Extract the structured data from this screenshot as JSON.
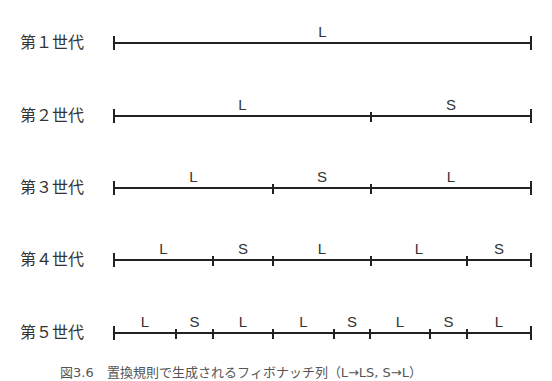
{
  "diagram": {
    "line_start_x": 114,
    "line_end_x": 531,
    "generations": [
      {
        "label": "第１世代",
        "y": 43,
        "segments": [
          {
            "label": "L",
            "from": 114,
            "to": 531
          }
        ]
      },
      {
        "label": "第２世代",
        "y": 116,
        "segments": [
          {
            "label": "L",
            "from": 114,
            "to": 371
          },
          {
            "label": "S",
            "from": 371,
            "to": 531
          }
        ]
      },
      {
        "label": "第３世代",
        "y": 188,
        "segments": [
          {
            "label": "L",
            "from": 114,
            "to": 273
          },
          {
            "label": "S",
            "from": 273,
            "to": 371
          },
          {
            "label": "L",
            "from": 371,
            "to": 531
          }
        ]
      },
      {
        "label": "第４世代",
        "y": 260,
        "segments": [
          {
            "label": "L",
            "from": 114,
            "to": 213
          },
          {
            "label": "S",
            "from": 213,
            "to": 273
          },
          {
            "label": "L",
            "from": 273,
            "to": 371
          },
          {
            "label": "L",
            "from": 371,
            "to": 467
          },
          {
            "label": "S",
            "from": 467,
            "to": 531
          }
        ]
      },
      {
        "label": "第５世代",
        "y": 333,
        "segments": [
          {
            "label": "L",
            "from": 114,
            "to": 176
          },
          {
            "label": "S",
            "from": 176,
            "to": 213
          },
          {
            "label": "L",
            "from": 213,
            "to": 273
          },
          {
            "label": "L",
            "from": 273,
            "to": 334
          },
          {
            "label": "S",
            "from": 334,
            "to": 370
          },
          {
            "label": "L",
            "from": 370,
            "to": 430
          },
          {
            "label": "S",
            "from": 430,
            "to": 467
          },
          {
            "label": "L",
            "from": 467,
            "to": 531
          }
        ]
      }
    ],
    "caption": "図3.6　置換規則で生成されるフィボナッチ列（L→LS, S→L）"
  }
}
